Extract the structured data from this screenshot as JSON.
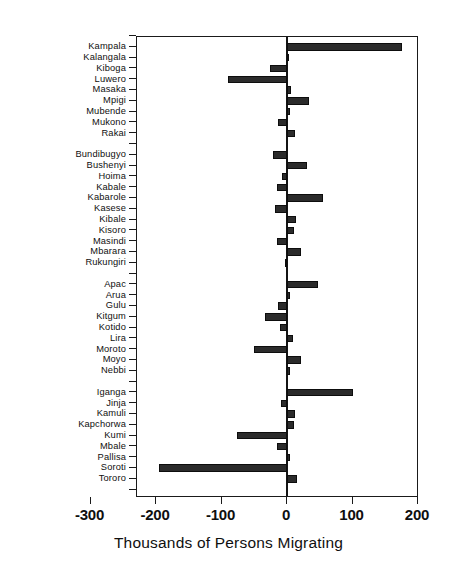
{
  "chart_data": {
    "type": "bar",
    "orientation": "horizontal",
    "title": "",
    "xlabel": "Thousands of Persons Migrating",
    "ylabel": "",
    "xlim": [
      -300,
      230
    ],
    "xticks": [
      -300,
      -200,
      -100,
      0,
      100,
      200
    ],
    "xticklabels": [
      "-300",
      "-200",
      "-100",
      "0",
      "100",
      "200"
    ],
    "grid": false,
    "legend": null,
    "bar_color": "#2b2b2b",
    "zero_reference": 0,
    "groups": [
      {
        "name": "",
        "categories": [
          "Kampala",
          "Kalangala",
          "Kiboga",
          "Luwero",
          "Masaka",
          "Mpigi",
          "Mubende",
          "Mukono",
          "Rakai"
        ],
        "values": [
          175,
          3,
          -26,
          -90,
          6,
          33,
          4,
          -13,
          12
        ]
      },
      {
        "name": "",
        "categories": [
          "Bundibugyo",
          "Bushenyi",
          "Hoima",
          "Kabale",
          "Kabarole",
          "Kasese",
          "Kibale",
          "Kisoro",
          "Masindi",
          "Mbarara",
          "Rukungiri"
        ],
        "values": [
          -22,
          30,
          -8,
          -16,
          55,
          -18,
          14,
          10,
          -16,
          22,
          -3
        ]
      },
      {
        "name": "",
        "categories": [
          "Apac",
          "Arua",
          "Gulu",
          "Kitgum",
          "Kotido",
          "Lira",
          "Moroto",
          "Moyo",
          "Nebbi"
        ],
        "values": [
          48,
          4,
          -13,
          -33,
          -10,
          9,
          -50,
          22,
          4
        ]
      },
      {
        "name": "",
        "categories": [
          "Iganga",
          "Jinja",
          "Kamuli",
          "Kapchorwa",
          "Kumi",
          "Mbale",
          "Pallisa",
          "Soroti",
          "Tororo"
        ],
        "values": [
          100,
          -9,
          12,
          10,
          -76,
          -16,
          5,
          -195,
          16
        ]
      }
    ],
    "categories": [
      "Kampala",
      "Kalangala",
      "Kiboga",
      "Luwero",
      "Masaka",
      "Mpigi",
      "Mubende",
      "Mukono",
      "Rakai",
      "Bundibugyo",
      "Bushenyi",
      "Hoima",
      "Kabale",
      "Kabarole",
      "Kasese",
      "Kibale",
      "Kisoro",
      "Masindi",
      "Mbarara",
      "Rukungiri",
      "Apac",
      "Arua",
      "Gulu",
      "Kitgum",
      "Kotido",
      "Lira",
      "Moroto",
      "Moyo",
      "Nebbi",
      "Iganga",
      "Jinja",
      "Kamuli",
      "Kapchorwa",
      "Kumi",
      "Mbale",
      "Pallisa",
      "Soroti",
      "Tororo"
    ],
    "values": [
      175,
      3,
      -26,
      -90,
      6,
      33,
      4,
      -13,
      12,
      -22,
      30,
      -8,
      -16,
      55,
      -18,
      14,
      10,
      -16,
      22,
      -3,
      48,
      4,
      -13,
      -33,
      -10,
      9,
      -50,
      22,
      4,
      100,
      -9,
      12,
      10,
      -76,
      -16,
      5,
      -195,
      16
    ]
  }
}
